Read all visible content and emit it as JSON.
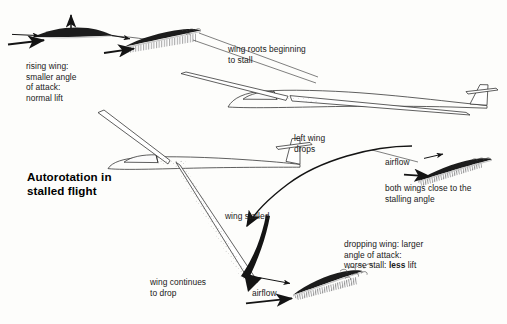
{
  "diagram": {
    "title": "Autorotation in\nstalled flight",
    "title_lines": [
      "Autorotation in",
      "stalled flight"
    ],
    "background_color": "#fdfdfb",
    "ink_color": "#1a1a1a"
  },
  "labels": {
    "rising_wing": "rising wing:\nsmaller angle\nof attack:\nnormal lift",
    "wing_roots": "wing roots beginning\nto stall",
    "left_wing_drops": "left wing\ndrops",
    "airflow_right": "airflow",
    "both_wings": "both wings close to the\nstalling angle",
    "wing_stalled": "wing stalled",
    "dropping_wing_line1": "dropping wing: larger",
    "dropping_wing_line2": "angle of attack:",
    "dropping_wing_line3_pre": "worse stall: ",
    "dropping_wing_line3_em": "less",
    "dropping_wing_line3_post": " lift",
    "wing_continues": "wing continues\nto drop",
    "airflow_bottom": "airflow"
  },
  "figures": {
    "airfoil_rising": "airfoil-section-normal-lift",
    "airfoil_root_stall": "airfoil-section-beginning-stall",
    "airfoil_near_stall": "airfoil-section-near-stalling-angle",
    "airfoil_deep_stall": "airfoil-section-deep-stall",
    "glider_level": "glider-level-flight",
    "glider_banked": "glider-banked-autorotating"
  },
  "arrows": {
    "lift_up": "lift-arrow-up",
    "relative_airflow": "relative-airflow-arrow",
    "roll_curve": "roll-direction-curved-arrow",
    "drop_curve": "wing-drop-curved-arrow"
  }
}
